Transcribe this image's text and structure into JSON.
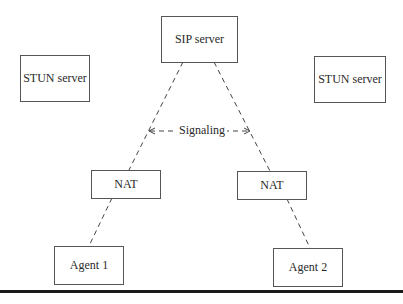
{
  "diagram": {
    "nodes": {
      "sip_server": {
        "label": "SIP server"
      },
      "stun_left": {
        "label": "STUN server"
      },
      "stun_right": {
        "label": "STUN server"
      },
      "nat_left": {
        "label": "NAT"
      },
      "nat_right": {
        "label": "NAT"
      },
      "agent1": {
        "label": "Agent 1"
      },
      "agent2": {
        "label": "Agent 2"
      }
    },
    "edges": [
      {
        "from": "sip_server",
        "to": "nat_left",
        "style": "dashed"
      },
      {
        "from": "sip_server",
        "to": "nat_right",
        "style": "dashed"
      },
      {
        "from": "nat_left",
        "to": "agent1",
        "style": "dashed"
      },
      {
        "from": "nat_right",
        "to": "agent2",
        "style": "dashed"
      }
    ],
    "annotation": {
      "label": "Signaling",
      "style": "dashed-double-arrow"
    }
  }
}
